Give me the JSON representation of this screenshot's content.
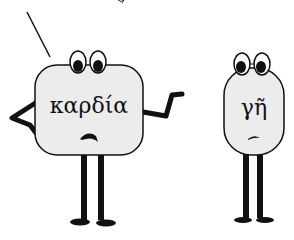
{
  "illustration": {
    "characters": [
      {
        "id": "left",
        "label": "καρδία",
        "expression": "worried",
        "pose": "hand-on-hip-gesturing"
      },
      {
        "id": "right",
        "label": "γῆ",
        "expression": "glum",
        "pose": "standing"
      }
    ],
    "colors": {
      "body_fill": "#ececec",
      "outline": "#111111",
      "background": "#ffffff"
    }
  }
}
